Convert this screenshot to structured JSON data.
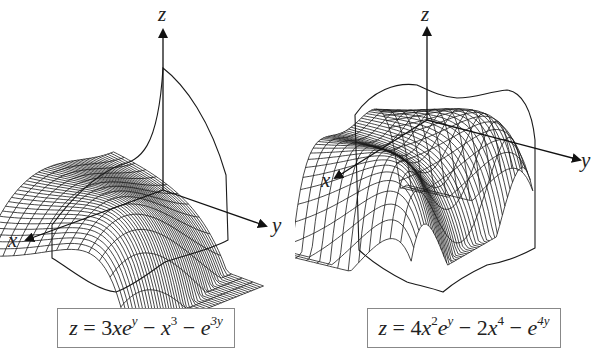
{
  "figures": [
    {
      "id": "left",
      "axes": {
        "z": "z",
        "x": "x",
        "y": "y"
      },
      "equation": {
        "text": "z = 3xe^y − x^3 − e^{3y}",
        "parts": {
          "lhs": "z",
          "eq": " = ",
          "t1_coef": "3",
          "t1_var": "xe",
          "t1_sup": "y",
          "op1": " − ",
          "t2_var": "x",
          "t2_sup": "3",
          "op2": " − ",
          "t3_var": "e",
          "t3_sup": "3y"
        }
      }
    },
    {
      "id": "right",
      "axes": {
        "z": "z",
        "x": "x",
        "y": "y"
      },
      "equation": {
        "text": "z = 4x^2e^y − 2x^4 − e^{4y}",
        "parts": {
          "lhs": "z",
          "eq": " = ",
          "t1_coef": "4",
          "t1_var": "x",
          "t1_sup": "2",
          "t1_var2": "e",
          "t1_sup2": "y",
          "op1": " − ",
          "t2_coef": "2",
          "t2_var": "x",
          "t2_sup": "4",
          "op2": " − ",
          "t3_var": "e",
          "t3_sup": "4y"
        }
      }
    }
  ],
  "colors": {
    "line": "#1a1a1a",
    "box_border": "#888888",
    "background": "#ffffff"
  }
}
